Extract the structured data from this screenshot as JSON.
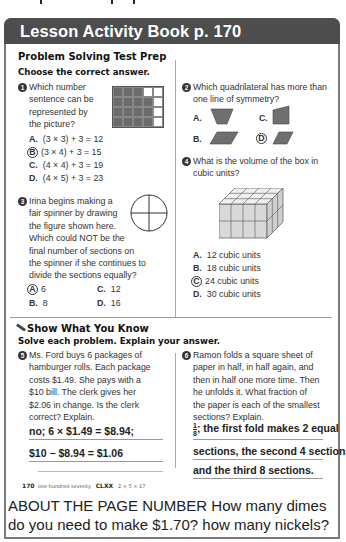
{
  "header": {
    "title": "Lesson Activity Book p. 170"
  },
  "section1": {
    "title": "Problem Solving Test Prep",
    "instruction": "Choose the correct answer."
  },
  "questions": [
    {
      "num": "1",
      "lines": [
        "Which number",
        "sentence can be",
        "represented by",
        "the picture?"
      ],
      "figure": {
        "type": "grid",
        "cols": 5,
        "rows": 4,
        "shaded_per_row": [
          3,
          4,
          4,
          4
        ]
      },
      "options": [
        {
          "letter": "A.",
          "text": "(3 × 3) + 3 = 12"
        },
        {
          "letter": "B.",
          "text": "(3 × 4) + 3 = 15",
          "circled": true
        },
        {
          "letter": "C.",
          "text": "(4 × 4) + 3 = 19"
        },
        {
          "letter": "D.",
          "text": "(4 × 5) + 3 = 23"
        }
      ]
    },
    {
      "num": "2",
      "lines": [
        "Which quadrilateral has more than",
        "one line of symmetry?"
      ],
      "options": [
        {
          "letter": "A.",
          "shape": "trapezoid"
        },
        {
          "letter": "B.",
          "shape": "parallelogram"
        },
        {
          "letter": "C.",
          "shape": "right-trapezoid"
        },
        {
          "letter": "D.",
          "shape": "rhombus",
          "circled": true
        }
      ]
    },
    {
      "num": "3",
      "lines": [
        "Irina begins making a",
        "fair spinner by drawing",
        "the figure shown here.",
        "Which could NOT be the",
        "final number of sections on",
        "the spinner if she continues to",
        "divide the sections equally?"
      ],
      "figure": {
        "type": "circle-quartered"
      },
      "options": [
        {
          "letter": "A.",
          "text": "6",
          "circled": true
        },
        {
          "letter": "B.",
          "text": "8"
        },
        {
          "letter": "C.",
          "text": "12"
        },
        {
          "letter": "D.",
          "text": "16"
        }
      ]
    },
    {
      "num": "4",
      "lines": [
        "What is the volume of the box in",
        "cubic units?"
      ],
      "figure": {
        "type": "cube-box",
        "width": 4,
        "height": 2,
        "depth": 3
      },
      "options": [
        {
          "letter": "A.",
          "text": "12 cubic units"
        },
        {
          "letter": "B.",
          "text": "18 cubic units"
        },
        {
          "letter": "C.",
          "text": "24 cubic units",
          "circled": true
        },
        {
          "letter": "D.",
          "text": "30 cubic units"
        }
      ]
    }
  ],
  "section2": {
    "title": "Show What You Know",
    "instruction": "Solve each problem. Explain your answer.",
    "icon": "pencil-icon"
  },
  "problems": [
    {
      "num": "5",
      "lines": [
        "Ms. Ford buys 6 packages of",
        "hamburger rolls. Each package",
        "costs $1.49. She pays with a",
        "$10 bill. The clerk gives her",
        "$2.06 in change. Is the clerk",
        "correct? Explain."
      ],
      "answer_lines": [
        "no; 6 × $1.49 = $8.94;",
        "$10 − $8.94 = $1.06"
      ]
    },
    {
      "num": "6",
      "lines": [
        "Ramon folds a square sheet of",
        "paper in half, in half again, and",
        "then in half one more time. Then",
        "he unfolds it. What fraction of",
        "the paper is each of the smallest",
        "sections? Explain."
      ],
      "answer_fraction": {
        "num": "1",
        "den": "8"
      },
      "answer_lines": [
        "; the first fold makes 2 equal",
        "sections, the second 4 sections,",
        "and the third 8 sections."
      ]
    }
  ],
  "footer": {
    "page": "170",
    "words": "one hundred seventy",
    "roman": "CLXX",
    "factors": "2 × 5 × 17"
  },
  "about": {
    "text": "ABOUT THE PAGE NUMBER  How many dimes do you need to make $1.70? how many nickels?"
  },
  "colors": {
    "header_bg": "#4d4d4d",
    "shade": "#6b6b6b",
    "frame": "#7a7a7a"
  }
}
